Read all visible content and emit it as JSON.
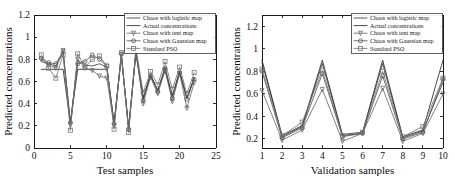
{
  "figure": {
    "background_color": "#ffffff",
    "panel_count": 2
  },
  "series_meta": [
    {
      "key": "logistic",
      "label": "Chaos with logistic map",
      "color": "#3c3c3c",
      "marker": "dot",
      "linewidth": 0.85
    },
    {
      "key": "actual",
      "label": "Actual concentrations",
      "color": "#2a2a2a",
      "marker": "none",
      "linewidth": 0.9
    },
    {
      "key": "tent",
      "label": "Chaos with tent map",
      "color": "#6b6b6b",
      "marker": "triangle",
      "linewidth": 0.85
    },
    {
      "key": "gaussian",
      "label": "Chaos with Gaussian map",
      "color": "#555555",
      "marker": "circle",
      "linewidth": 0.85
    },
    {
      "key": "pso",
      "label": "Standard PSO",
      "color": "#777777",
      "marker": "square",
      "linewidth": 0.85
    }
  ],
  "chart_data": [
    {
      "id": "test-samples-chart",
      "type": "line",
      "title": "",
      "xlabel": "Test samples",
      "ylabel": "Predicted concentrations",
      "xlim": [
        0,
        25
      ],
      "ylim": [
        0,
        1.2
      ],
      "xticks": [
        0,
        5,
        10,
        15,
        20,
        25
      ],
      "yticks": [
        0,
        0.2,
        0.4,
        0.6,
        0.8,
        1,
        1.2
      ],
      "xtick_labels": [
        "0",
        "5",
        "10",
        "15",
        "20",
        "25"
      ],
      "ytick_labels": [
        "0",
        "0.2",
        "0.4",
        "0.6",
        "0.8",
        "1",
        "1.2"
      ],
      "grid": false,
      "legend_position": "top-right",
      "x": [
        1,
        2,
        3,
        4,
        5,
        6,
        7,
        8,
        9,
        10,
        11,
        12,
        13,
        14,
        15,
        16,
        17,
        18,
        19,
        20,
        21,
        22
      ],
      "series": [
        {
          "name": "Chaos with logistic map",
          "values": [
            0.78,
            0.76,
            0.74,
            0.86,
            0.22,
            0.79,
            0.75,
            0.74,
            0.76,
            0.73,
            0.22,
            0.83,
            0.18,
            0.86,
            0.45,
            0.66,
            0.52,
            0.73,
            0.47,
            0.69,
            0.45,
            0.63
          ]
        },
        {
          "name": "Actual concentrations",
          "values": [
            0.71,
            0.71,
            0.71,
            0.71,
            0.22,
            0.71,
            0.71,
            0.71,
            0.71,
            0.71,
            0.22,
            0.83,
            0.18,
            0.86,
            0.45,
            0.66,
            0.52,
            0.7,
            0.47,
            0.69,
            0.45,
            0.63
          ]
        },
        {
          "name": "Chaos with tent map",
          "values": [
            0.8,
            0.75,
            0.72,
            0.88,
            0.21,
            0.8,
            0.72,
            0.7,
            0.65,
            0.63,
            0.2,
            0.84,
            0.16,
            0.87,
            0.4,
            0.64,
            0.49,
            0.7,
            0.42,
            0.67,
            0.36,
            0.59
          ]
        },
        {
          "name": "Chaos with Gaussian map",
          "values": [
            0.81,
            0.77,
            0.76,
            0.87,
            0.23,
            0.76,
            0.78,
            0.84,
            0.8,
            0.74,
            0.22,
            0.85,
            0.17,
            0.88,
            0.43,
            0.65,
            0.51,
            0.72,
            0.45,
            0.68,
            0.44,
            0.62
          ]
        },
        {
          "name": "Standard PSO",
          "values": [
            0.84,
            0.72,
            0.63,
            0.84,
            0.16,
            0.85,
            0.73,
            0.8,
            0.83,
            0.74,
            0.17,
            0.86,
            0.14,
            0.9,
            0.5,
            0.69,
            0.57,
            0.78,
            0.53,
            0.73,
            0.49,
            0.68
          ]
        }
      ]
    },
    {
      "id": "validation-samples-chart",
      "type": "line",
      "title": "",
      "xlabel": "Validation samples",
      "ylabel": "Predicted concentrations",
      "xlim": [
        1,
        10
      ],
      "ylim": [
        0.12,
        1.3
      ],
      "xticks": [
        1,
        2,
        3,
        4,
        5,
        6,
        7,
        8,
        9,
        10
      ],
      "yticks": [
        0.2,
        0.4,
        0.6,
        0.8,
        1,
        1.2
      ],
      "xtick_labels": [
        "1",
        "2",
        "3",
        "4",
        "5",
        "6",
        "7",
        "8",
        "9",
        "10"
      ],
      "ytick_labels": [
        "0.2",
        "0.4",
        "0.6",
        "0.8",
        "1",
        "1.2"
      ],
      "grid": false,
      "legend_position": "top-right",
      "x": [
        1,
        2,
        3,
        4,
        5,
        6,
        7,
        8,
        9,
        10
      ],
      "series": [
        {
          "name": "Chaos with logistic map",
          "values": [
            0.88,
            0.22,
            0.31,
            0.87,
            0.23,
            0.25,
            0.87,
            0.21,
            0.27,
            0.7
          ]
        },
        {
          "name": "Actual concentrations",
          "values": [
            0.9,
            0.23,
            0.32,
            0.9,
            0.24,
            0.26,
            0.9,
            0.22,
            0.28,
            0.9
          ]
        },
        {
          "name": "Chaos with tent map",
          "values": [
            0.63,
            0.19,
            0.28,
            0.64,
            0.18,
            0.25,
            0.65,
            0.18,
            0.25,
            0.6
          ]
        },
        {
          "name": "Chaos with Gaussian map",
          "values": [
            0.8,
            0.21,
            0.3,
            0.78,
            0.22,
            0.25,
            0.76,
            0.2,
            0.26,
            0.73
          ]
        },
        {
          "name": "Standard PSO",
          "values": [
            0.82,
            0.23,
            0.35,
            0.81,
            0.23,
            0.26,
            0.8,
            0.22,
            0.31,
            0.74
          ]
        }
      ]
    }
  ]
}
